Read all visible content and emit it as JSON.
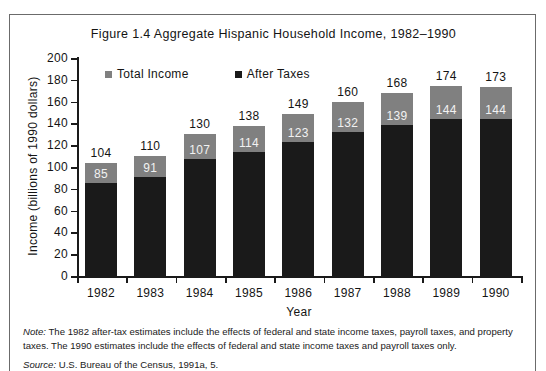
{
  "figure": {
    "title": "Figure 1.4   Aggregate Hispanic Household Income, 1982–1990",
    "note_prefix": "Note:",
    "note_text": " The 1982 after-tax estimates include the effects of federal and state income taxes, payroll taxes, and property taxes. The 1990 estimates include the effects of federal and state income taxes and payroll taxes only.",
    "source_prefix": "Source:",
    "source_text": " U.S. Bureau of the Census, 1991a, 5."
  },
  "colors": {
    "total_income": "#808080",
    "after_taxes": "#1a1a1a",
    "axis": "#1a1a1a",
    "frame": "#6b6b6b",
    "text": "#141414",
    "inverse_text": "#f2f2f2",
    "background": "#ffffff"
  },
  "legend": {
    "position": "top-left-inside",
    "entries": [
      {
        "label": "Total Income",
        "color": "#808080"
      },
      {
        "label": "After Taxes",
        "color": "#1a1a1a"
      }
    ]
  },
  "chart_data": {
    "type": "bar",
    "stacked": true,
    "title": "Figure 1.4   Aggregate Hispanic Household Income, 1982–1990",
    "xlabel": "Year",
    "ylabel": "Income (billions of 1990 dollars)",
    "ylim": [
      0,
      200
    ],
    "ytick_step": 20,
    "yticks": [
      0,
      20,
      40,
      60,
      80,
      100,
      120,
      140,
      160,
      180,
      200
    ],
    "ytick_labels": [
      "0",
      "20",
      "40",
      "60",
      "80",
      "100",
      "120",
      "140",
      "160",
      "180",
      "200"
    ],
    "grid": false,
    "categories": [
      "1982",
      "1983",
      "1984",
      "1985",
      "1986",
      "1987",
      "1988",
      "1989",
      "1990"
    ],
    "series": [
      {
        "name": "Total Income",
        "color": "#808080",
        "values": [
          104,
          110,
          130,
          138,
          149,
          160,
          168,
          174,
          173
        ]
      },
      {
        "name": "After Taxes",
        "color": "#1a1a1a",
        "values": [
          85,
          91,
          107,
          114,
          123,
          132,
          139,
          144,
          144
        ]
      }
    ],
    "bars": [
      {
        "year": "1982",
        "total": 104,
        "after_taxes": 85,
        "total_label": "104",
        "after_label": "85"
      },
      {
        "year": "1983",
        "total": 110,
        "after_taxes": 91,
        "total_label": "110",
        "after_label": "91"
      },
      {
        "year": "1984",
        "total": 130,
        "after_taxes": 107,
        "total_label": "130",
        "after_label": "107"
      },
      {
        "year": "1985",
        "total": 138,
        "after_taxes": 114,
        "total_label": "138",
        "after_label": "114"
      },
      {
        "year": "1986",
        "total": 149,
        "after_taxes": 123,
        "total_label": "149",
        "after_label": "123"
      },
      {
        "year": "1987",
        "total": 160,
        "after_taxes": 132,
        "total_label": "160",
        "after_label": "132"
      },
      {
        "year": "1988",
        "total": 168,
        "after_taxes": 139,
        "total_label": "168",
        "after_label": "139"
      },
      {
        "year": "1989",
        "total": 174,
        "after_taxes": 144,
        "total_label": "174",
        "after_label": "144"
      },
      {
        "year": "1990",
        "total": 173,
        "after_taxes": 144,
        "total_label": "173",
        "after_label": "144"
      }
    ]
  }
}
